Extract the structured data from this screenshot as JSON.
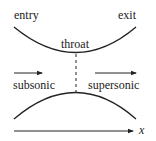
{
  "labels": {
    "entry": "entry",
    "exit": "exit",
    "throat": "throat",
    "subsonic": "subsonic",
    "supersonic": "supersonic",
    "x_axis": "x"
  },
  "colors": {
    "stroke": "#222222",
    "background": "#ffffff"
  }
}
